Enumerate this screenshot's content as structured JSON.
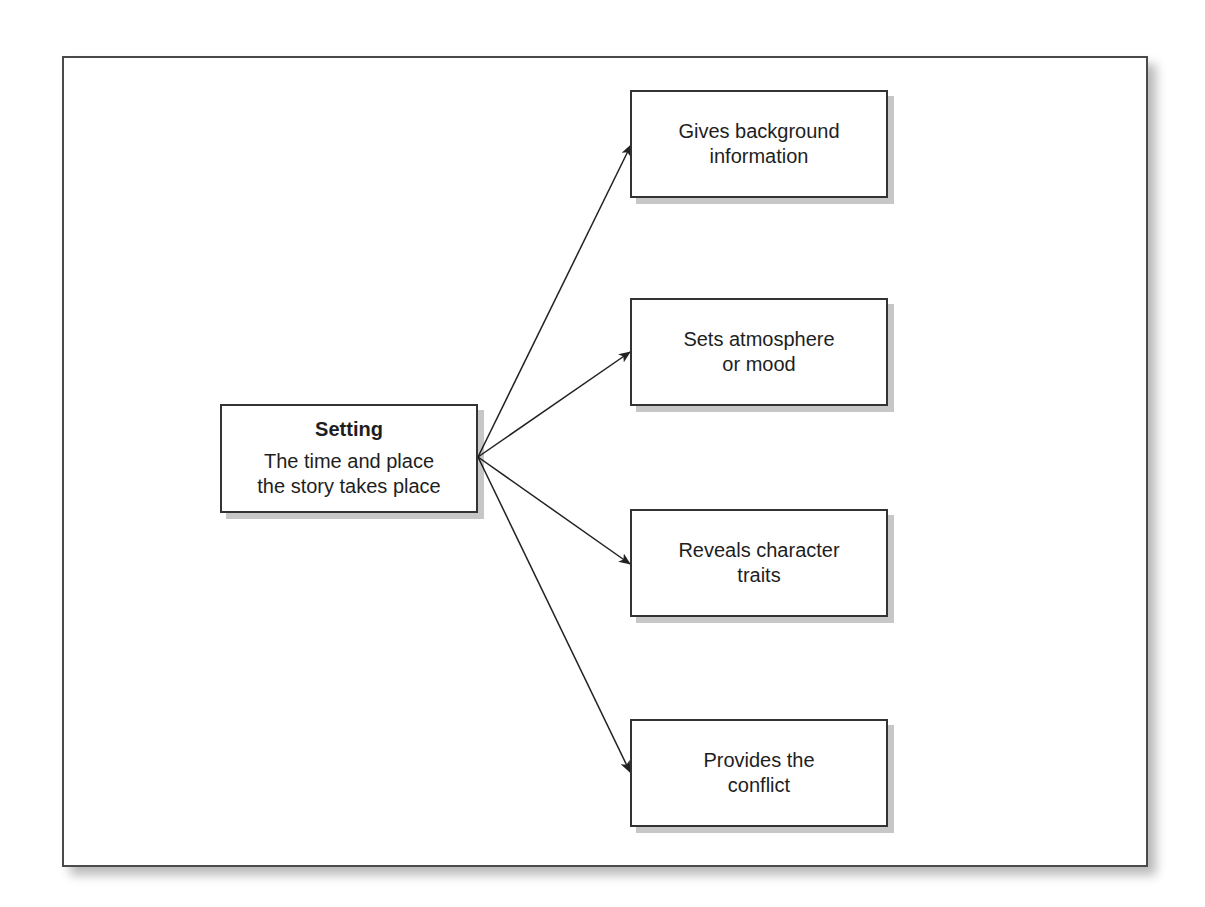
{
  "diagram": {
    "root": {
      "title": "Setting",
      "description": "The time and place\nthe story takes place"
    },
    "children": [
      {
        "label": "Gives background\ninformation"
      },
      {
        "label": "Sets atmosphere\nor mood"
      },
      {
        "label": "Reveals character\ntraits"
      },
      {
        "label": "Provides the\nconflict"
      }
    ],
    "colors": {
      "border": "#333333",
      "arrow": "#222222",
      "shadow": "#b8b8b8"
    }
  }
}
